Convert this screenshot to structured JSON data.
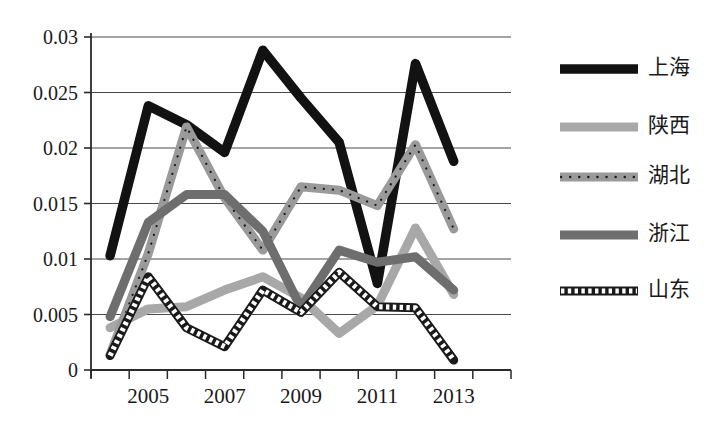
{
  "chart_data": {
    "type": "line",
    "title": "",
    "xlabel": "",
    "ylabel": "",
    "x": [
      2004,
      2005,
      2006,
      2007,
      2008,
      2009,
      2010,
      2011,
      2012,
      2013
    ],
    "xtick_labels": [
      "2005",
      "2007",
      "2009",
      "2011",
      "2013"
    ],
    "xtick_values": [
      2005,
      2007,
      2009,
      2011,
      2013
    ],
    "ytick_labels": [
      "0",
      "0.005",
      "0.01",
      "0.015",
      "0.02",
      "0.025",
      "0.03"
    ],
    "ytick_values": [
      0,
      0.005,
      0.01,
      0.015,
      0.02,
      0.025,
      0.03
    ],
    "ylim": [
      0,
      0.03
    ],
    "xlim": [
      2003.5,
      2013.5
    ],
    "grid": true,
    "legend_position": "right",
    "series": [
      {
        "name": "上海",
        "color": "#121212",
        "style": "solid-thick",
        "values": [
          0.0103,
          0.0238,
          0.0221,
          0.0196,
          0.0288,
          0.0245,
          0.0205,
          0.0078,
          0.0276,
          0.0188
        ]
      },
      {
        "name": "陕西",
        "color": "#a8a8a8",
        "style": "solid-thick",
        "values": [
          0.0038,
          0.0055,
          0.0057,
          0.0072,
          0.0084,
          0.0065,
          0.0033,
          0.0058,
          0.0128,
          0.0068
        ]
      },
      {
        "name": "湖北",
        "color": "#9a9a9a",
        "style": "dotted-overlay",
        "values": [
          0.0014,
          0.0105,
          0.0219,
          0.0155,
          0.0108,
          0.0165,
          0.0162,
          0.0148,
          0.0203,
          0.0127
        ]
      },
      {
        "name": "浙江",
        "color": "#6e6e6e",
        "style": "solid-thick",
        "values": [
          0.0048,
          0.0133,
          0.0158,
          0.0158,
          0.0125,
          0.0056,
          0.0108,
          0.0097,
          0.0102,
          0.0072
        ]
      },
      {
        "name": "山东",
        "color": "#1a1a1a",
        "style": "x-marker",
        "values": [
          0.0013,
          0.0084,
          0.0038,
          0.0021,
          0.0072,
          0.0052,
          0.0088,
          0.0057,
          0.0056,
          0.0009
        ]
      }
    ]
  },
  "legend": {
    "items": [
      {
        "label": "上海"
      },
      {
        "label": "陕西"
      },
      {
        "label": "湖北"
      },
      {
        "label": "浙江"
      },
      {
        "label": "山东"
      }
    ]
  },
  "caption": {
    "text": ""
  }
}
